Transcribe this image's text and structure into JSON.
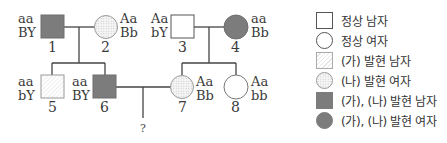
{
  "pedigree": {
    "individuals": [
      {
        "id": "1",
        "number": "1",
        "sex": "male",
        "phenotype": "(가), (나) 발현",
        "genotype": [
          "aa",
          "BY"
        ]
      },
      {
        "id": "2",
        "number": "2",
        "sex": "female",
        "phenotype": "(나) 발현",
        "genotype": [
          "Aa",
          "Bb"
        ]
      },
      {
        "id": "3",
        "number": "3",
        "sex": "male",
        "phenotype": "정상",
        "genotype": [
          "Aa",
          "bY"
        ]
      },
      {
        "id": "4",
        "number": "4",
        "sex": "female",
        "phenotype": "(가), (나) 발현",
        "genotype": [
          "aa",
          "Bb"
        ]
      },
      {
        "id": "5",
        "number": "5",
        "sex": "male",
        "phenotype": "(가) 발현",
        "genotype": [
          "aa",
          "bY"
        ]
      },
      {
        "id": "6",
        "number": "6",
        "sex": "male",
        "phenotype": "(가), (나) 발현",
        "genotype": [
          "aa",
          "BY"
        ]
      },
      {
        "id": "7",
        "number": "7",
        "sex": "female",
        "phenotype": "(나) 발현",
        "genotype": [
          "Aa",
          "Bb"
        ]
      },
      {
        "id": "8",
        "number": "8",
        "sex": "female",
        "phenotype": "정상",
        "genotype": [
          "Aa",
          "bb"
        ]
      }
    ],
    "unknown_child": "?"
  },
  "legend": {
    "items": [
      {
        "shape": "square",
        "style": "normal",
        "label": "정상 남자"
      },
      {
        "shape": "circle",
        "style": "normal",
        "label": "정상 여자"
      },
      {
        "shape": "square",
        "style": "hatch",
        "label": "(가) 발현 남자"
      },
      {
        "shape": "circle",
        "style": "dots",
        "label": "(나) 발현 여자"
      },
      {
        "shape": "square",
        "style": "fill",
        "label": "(가), (나) 발현 남자"
      },
      {
        "shape": "circle",
        "style": "fill",
        "label": "(가), (나) 발현 여자"
      }
    ]
  },
  "colors": {
    "affected_both": "#7c7c7c",
    "line": "#444444"
  }
}
